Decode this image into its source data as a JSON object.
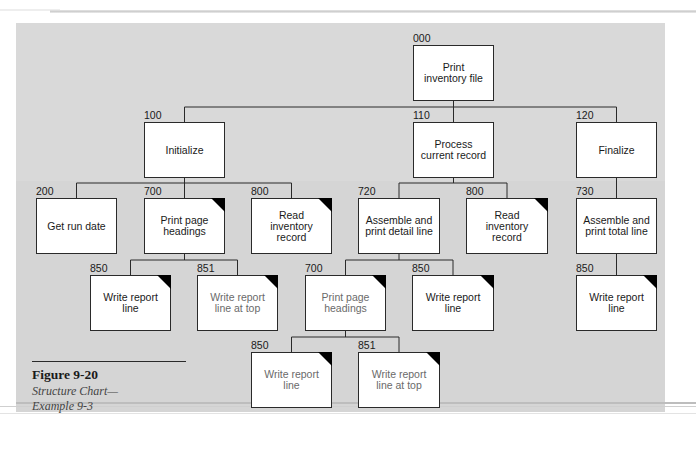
{
  "figure": {
    "number": "Figure 9-20",
    "caption_line1": "Structure Chart—",
    "caption_line2": "Example 9-3"
  },
  "colors": {
    "panel_background": "#d9d9d9",
    "box_fill": "#ffffff",
    "box_border": "#2a2a2a",
    "corner_marker": "#000000"
  },
  "nodes": [
    {
      "id": "n000",
      "code": "000",
      "label": "Print inventory file",
      "x": 413,
      "y": 45,
      "w": 81,
      "h": 56,
      "corner": false,
      "faded": false
    },
    {
      "id": "n100",
      "code": "100",
      "label": "Initialize",
      "x": 144,
      "y": 122,
      "w": 81,
      "h": 56,
      "corner": false,
      "faded": false
    },
    {
      "id": "n110",
      "code": "110",
      "label": "Process current record",
      "x": 413,
      "y": 122,
      "w": 81,
      "h": 56,
      "corner": false,
      "faded": false
    },
    {
      "id": "n120",
      "code": "120",
      "label": "Finalize",
      "x": 576,
      "y": 122,
      "w": 81,
      "h": 56,
      "corner": false,
      "faded": false
    },
    {
      "id": "n200",
      "code": "200",
      "label": "Get run date",
      "x": 36,
      "y": 198,
      "w": 81,
      "h": 56,
      "corner": false,
      "faded": false
    },
    {
      "id": "n700a",
      "code": "700",
      "label": "Print page headings",
      "x": 144,
      "y": 198,
      "w": 81,
      "h": 56,
      "corner": true,
      "faded": false
    },
    {
      "id": "n800a",
      "code": "800",
      "label": "Read inventory record",
      "x": 251,
      "y": 198,
      "w": 81,
      "h": 56,
      "corner": true,
      "faded": false
    },
    {
      "id": "n720",
      "code": "720",
      "label": "Assemble and print detail line",
      "x": 358,
      "y": 198,
      "w": 82,
      "h": 56,
      "corner": false,
      "faded": false
    },
    {
      "id": "n800b",
      "code": "800",
      "label": "Read inventory record",
      "x": 466,
      "y": 198,
      "w": 82,
      "h": 56,
      "corner": true,
      "faded": false
    },
    {
      "id": "n730",
      "code": "730",
      "label": "Assemble and print total line",
      "x": 576,
      "y": 198,
      "w": 81,
      "h": 56,
      "corner": false,
      "faded": false
    },
    {
      "id": "n850a",
      "code": "850",
      "label": "Write report line",
      "x": 90,
      "y": 275,
      "w": 81,
      "h": 56,
      "corner": true,
      "faded": false
    },
    {
      "id": "n851a",
      "code": "851",
      "label": "Write report line at top",
      "x": 197,
      "y": 275,
      "w": 81,
      "h": 56,
      "corner": true,
      "faded": true
    },
    {
      "id": "n700b",
      "code": "700",
      "label": "Print page headings",
      "x": 305,
      "y": 275,
      "w": 81,
      "h": 56,
      "corner": true,
      "faded": true
    },
    {
      "id": "n850b",
      "code": "850",
      "label": "Write report line",
      "x": 412,
      "y": 275,
      "w": 82,
      "h": 56,
      "corner": true,
      "faded": false
    },
    {
      "id": "n850c",
      "code": "850",
      "label": "Write report line",
      "x": 576,
      "y": 275,
      "w": 81,
      "h": 56,
      "corner": true,
      "faded": false
    },
    {
      "id": "n850d",
      "code": "850",
      "label": "Write report line",
      "x": 251,
      "y": 352,
      "w": 81,
      "h": 56,
      "corner": true,
      "faded": true
    },
    {
      "id": "n851b",
      "code": "851",
      "label": "Write report line at top",
      "x": 358,
      "y": 352,
      "w": 82,
      "h": 56,
      "corner": true,
      "faded": true
    }
  ],
  "edges": [
    {
      "parent": "n000",
      "bus_y": 107,
      "children": [
        "n100",
        "n110",
        "n120"
      ]
    },
    {
      "parent": "n100",
      "bus_y": 183,
      "children": [
        "n200",
        "n700a",
        "n800a"
      ]
    },
    {
      "parent": "n110",
      "bus_y": 183,
      "children": [
        "n720",
        "n800b"
      ]
    },
    {
      "parent": "n120",
      "bus_y": 183,
      "children": [
        "n730"
      ]
    },
    {
      "parent": "n700a",
      "bus_y": 260,
      "children": [
        "n850a",
        "n851a"
      ]
    },
    {
      "parent": "n720",
      "bus_y": 260,
      "children": [
        "n700b",
        "n850b"
      ]
    },
    {
      "parent": "n730",
      "bus_y": 260,
      "children": [
        "n850c"
      ]
    },
    {
      "parent": "n700b",
      "bus_y": 337,
      "children": [
        "n850d",
        "n851b"
      ]
    }
  ]
}
